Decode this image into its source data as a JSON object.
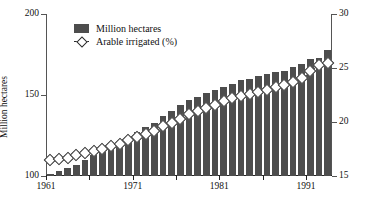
{
  "chart_data": {
    "type": "bar",
    "title": "",
    "subtitle": "",
    "xlabel": "",
    "ylabel": "Million hectares",
    "y2label": "Arable irrigated (%)",
    "ylim": [
      100,
      200
    ],
    "y2lim": [
      15,
      30
    ],
    "yticks": [
      "100",
      "150",
      "200"
    ],
    "ytick_values": [
      100,
      150,
      200
    ],
    "y2ticks": [
      "15",
      "20",
      "25",
      "30"
    ],
    "y2tick_values": [
      15,
      20,
      25,
      30
    ],
    "xticks": [
      "1961",
      "1971",
      "1981",
      "1991"
    ],
    "xtick_values": [
      1961,
      1971,
      1981,
      1991
    ],
    "xlim": [
      1960.5,
      1993.5
    ],
    "grid": false,
    "legend_position": "top-left",
    "categories": [
      "1961",
      "1962",
      "1963",
      "1964",
      "1965",
      "1966",
      "1967",
      "1968",
      "1969",
      "1970",
      "1971",
      "1972",
      "1973",
      "1974",
      "1975",
      "1976",
      "1977",
      "1978",
      "1979",
      "1980",
      "1981",
      "1982",
      "1983",
      "1984",
      "1985",
      "1986",
      "1987",
      "1988",
      "1989",
      "1990",
      "1991",
      "1992",
      "1993"
    ],
    "series": [
      {
        "name": "Million hectares",
        "type": "bar",
        "axis": "left",
        "color": "#4d4d4d",
        "values": [
          101,
          103,
          105,
          107,
          110,
          113,
          115,
          118,
          121,
          124,
          127,
          130,
          133,
          137,
          140,
          144,
          147,
          149,
          151,
          153,
          155,
          157,
          159,
          160,
          162,
          163,
          164,
          165,
          167,
          169,
          172,
          173,
          178
        ]
      },
      {
        "name": "Arable irrigated (%)",
        "type": "line",
        "axis": "right",
        "color": "#2a2a2a",
        "marker": "diamond",
        "marker_fill": "#ffffff",
        "values": [
          16.5,
          16.6,
          16.7,
          16.9,
          17.1,
          17.3,
          17.5,
          17.8,
          18.0,
          18.3,
          18.6,
          18.9,
          19.2,
          19.6,
          19.9,
          20.3,
          20.7,
          21.0,
          21.3,
          21.6,
          21.9,
          22.2,
          22.4,
          22.6,
          22.8,
          23.0,
          23.2,
          23.4,
          23.7,
          24.1,
          24.7,
          25.3,
          25.5
        ]
      }
    ]
  },
  "legend": {
    "items": [
      {
        "label": "Million hectares",
        "symbol": "filled-square"
      },
      {
        "label": "Arable irrigated (%)",
        "symbol": "line-diamond"
      }
    ]
  },
  "colors": {
    "bar": "#4d4d4d",
    "line": "#2a2a2a",
    "marker_fill": "#ffffff",
    "axis": "#555555",
    "background": "#ffffff"
  }
}
